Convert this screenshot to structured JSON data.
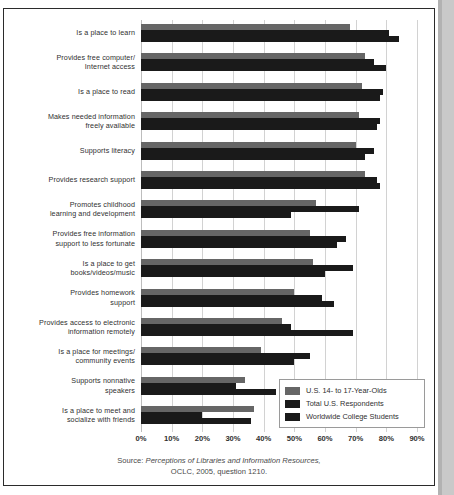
{
  "chart_data": {
    "type": "bar",
    "orientation": "horizontal",
    "title": "",
    "xlabel": "",
    "ylabel": "",
    "xlim": [
      0,
      90
    ],
    "xticks": [
      0,
      10,
      20,
      30,
      40,
      50,
      60,
      70,
      80,
      90
    ],
    "xtick_labels": [
      "0%",
      "10%",
      "20%",
      "30%",
      "40%",
      "50%",
      "60%",
      "70%",
      "80%",
      "90%"
    ],
    "grid": true,
    "legend_position": "bottom-right",
    "categories": [
      "Is a place to learn",
      "Provides free computer/\nInternet access",
      "Is a place to read",
      "Makes needed information\nfreely available",
      "Supports literacy",
      "Provides research support",
      "Promotes childhood\nlearning and development",
      "Provides free information\nsupport to less fortunate",
      "Is a place to get\nbooks/videos/music",
      "Provides homework\nsupport",
      "Provides access to electronic\ninformation remotely",
      "Is a place for meetings/\ncommunity events",
      "Supports nonnative\nspeakers",
      "Is a place to meet and\nsocialize with friends"
    ],
    "series": [
      {
        "name": "U.S. 14- to 17-Year-Olds",
        "color": "#666666",
        "values": [
          68,
          73,
          72,
          71,
          70,
          73,
          57,
          55,
          56,
          50,
          46,
          39,
          34,
          37
        ]
      },
      {
        "name": "Total U.S. Respondents",
        "color": "#1a1a1a",
        "values": [
          81,
          76,
          79,
          78,
          76,
          77,
          71,
          67,
          69,
          59,
          49,
          55,
          31,
          20
        ]
      },
      {
        "name": "Worldwide College Students",
        "color": "#1a1a1a",
        "values": [
          84,
          80,
          78,
          77,
          73,
          78,
          49,
          64,
          60,
          63,
          69,
          50,
          44,
          36
        ]
      }
    ],
    "source": {
      "word": "Source:",
      "title": "Perceptions of Libraries and Information Resources,",
      "detail": "OCLC, 2005, question 1210."
    }
  }
}
